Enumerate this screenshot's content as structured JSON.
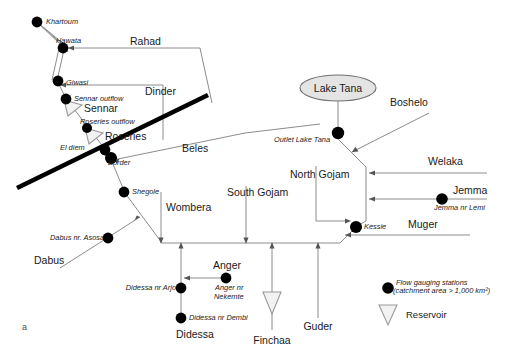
{
  "figure": {
    "panel_label": "a",
    "caption_title": "Blue Nile river system schematic"
  },
  "border": {
    "label": "Border"
  },
  "lake": {
    "name": "Lake Tana",
    "outlet_label": "Outlet Lake Tana"
  },
  "legend": {
    "gauging_line1": "Flow gauging stations",
    "gauging_line2": "(catchment area > 1,000 km²)",
    "reservoir": "Reservoir"
  },
  "reservoirs": [
    {
      "id": "sennar",
      "label": "Sennar"
    },
    {
      "id": "roseries",
      "label": "Roseries"
    },
    {
      "id": "finchaa",
      "label": "Finchaa"
    }
  ],
  "gauging_stations": [
    {
      "id": "khartoum",
      "label": "Khartoum"
    },
    {
      "id": "hawata",
      "label": "Hawata"
    },
    {
      "id": "giwasi",
      "label": "Giwasi"
    },
    {
      "id": "sennar-outflow",
      "label": "Sennar outflow"
    },
    {
      "id": "roseries-outflow",
      "label": "Roseries  outflow"
    },
    {
      "id": "el-diem",
      "label": "El diem"
    },
    {
      "id": "shegole",
      "label": "Shegole"
    },
    {
      "id": "dabus-nr-asosa",
      "label": "Dabus nr. Asosa"
    },
    {
      "id": "didessa-nr-arjo",
      "label": "Didessa nr Arjo"
    },
    {
      "id": "didessa-nr-dembi",
      "label": "Didessa nr Dembi"
    },
    {
      "id": "anger-nr-nekemte1",
      "label": "Anger nr"
    },
    {
      "id": "anger-nr-nekemte2",
      "label": "Nekemte"
    },
    {
      "id": "kessie",
      "label": "Kessie"
    },
    {
      "id": "jemma-nr-lemi",
      "label": "Jemma nr Lemi"
    }
  ],
  "tributaries": [
    {
      "id": "rahad",
      "label": "Rahad"
    },
    {
      "id": "dinder",
      "label": "Dinder"
    },
    {
      "id": "beles",
      "label": "Beles"
    },
    {
      "id": "boshelo",
      "label": "Boshelo"
    },
    {
      "id": "welaka",
      "label": "Welaka"
    },
    {
      "id": "jemma",
      "label": "Jemma"
    },
    {
      "id": "muger",
      "label": "Muger"
    },
    {
      "id": "north-gojam",
      "label": "North Gojam"
    },
    {
      "id": "south-gojam",
      "label": "South Gojam"
    },
    {
      "id": "wombera",
      "label": "Wombera"
    },
    {
      "id": "dabus",
      "label": "Dabus"
    },
    {
      "id": "didessa",
      "label": "Didessa"
    },
    {
      "id": "anger",
      "label": "Anger"
    },
    {
      "id": "guder",
      "label": "Guder"
    }
  ]
}
